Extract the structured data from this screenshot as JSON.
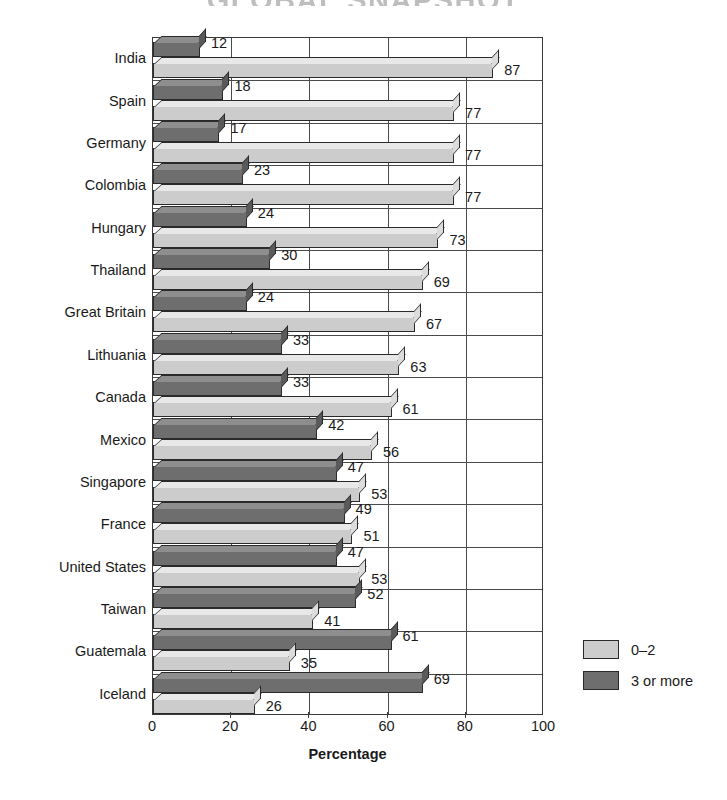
{
  "chart_data": {
    "type": "bar",
    "orientation": "horizontal",
    "title": "GLOBAL SNAPSHOT",
    "subtitle": "",
    "xlabel": "Percentage",
    "ylabel": "",
    "xlim": [
      0,
      100
    ],
    "xticks": [
      0,
      20,
      40,
      60,
      80,
      100
    ],
    "grid": true,
    "grid_axis": "x",
    "legend_position": "right",
    "categories": [
      "India",
      "Spain",
      "Germany",
      "Colombia",
      "Hungary",
      "Thailand",
      "Great Britain",
      "Lithuania",
      "Canada",
      "Mexico",
      "Singapore",
      "France",
      "United States",
      "Taiwan",
      "Guatemala",
      "Iceland"
    ],
    "series": [
      {
        "name": "3 or more",
        "color": "#6e6e6e",
        "values": [
          12,
          18,
          17,
          23,
          24,
          30,
          24,
          33,
          33,
          42,
          47,
          49,
          47,
          52,
          61,
          69
        ]
      },
      {
        "name": "0–2",
        "color": "#cccccc",
        "values": [
          87,
          77,
          77,
          77,
          73,
          69,
          67,
          63,
          61,
          56,
          53,
          51,
          53,
          41,
          35,
          26
        ]
      }
    ]
  },
  "legend": {
    "entries": [
      {
        "label": "0–2",
        "color": "#cccccc"
      },
      {
        "label": "3 or more",
        "color": "#6e6e6e"
      }
    ]
  },
  "colors": {
    "light_bar": "#cccccc",
    "dark_bar": "#6e6e6e",
    "axis": "#3a3a3a",
    "text": "#1a1a1a",
    "background": "#ffffff"
  }
}
